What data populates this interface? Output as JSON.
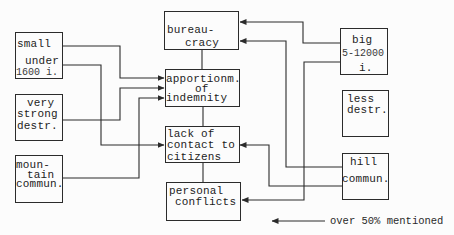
{
  "colors": {
    "line": "#2b2b2b",
    "text": "#1d1d1d",
    "background": "#fcfcfc"
  },
  "boxes": {
    "small": {
      "lines": [
        "small",
        "under",
        "1600 i."
      ]
    },
    "very_strong": {
      "lines": [
        "very",
        "strong",
        "destr."
      ]
    },
    "mountain": {
      "lines": [
        "moun-",
        "tain",
        "commun."
      ]
    },
    "bureaucracy": {
      "lines": [
        "bureau-",
        "cracy"
      ]
    },
    "apportionment": {
      "lines": [
        "apportionm.",
        "of",
        "indemnity"
      ]
    },
    "lack_of_contact": {
      "lines": [
        "lack of",
        "contact to",
        "citizens"
      ]
    },
    "personal_conflicts": {
      "lines": [
        "personal",
        "conflicts"
      ]
    },
    "big": {
      "lines": [
        "big",
        "5-12000",
        "i."
      ]
    },
    "less_destr": {
      "lines": [
        "less",
        "destr."
      ]
    },
    "hill": {
      "lines": [
        "hill",
        "commun."
      ]
    }
  },
  "connections": [
    {
      "from": "small (small)",
      "to": "apportionment of indemnity"
    },
    {
      "from": "small (under 1600 i.)",
      "to": "lack of contact to citizens"
    },
    {
      "from": "very strong destr.",
      "to": "apportionment of indemnity"
    },
    {
      "from": "mountain commun.",
      "to": "apportionment of indemnity"
    },
    {
      "from": "big 5-12000 i.",
      "to": "bureaucracy"
    },
    {
      "from": "big 5-12000 i.",
      "to": "personal conflicts"
    },
    {
      "from": "hill commun.",
      "to": "bureaucracy"
    },
    {
      "from": "hill commun.",
      "to": "lack of contact to citizens"
    }
  ],
  "legend": {
    "label": "over 50% mentioned",
    "symbol": "left-arrow"
  }
}
